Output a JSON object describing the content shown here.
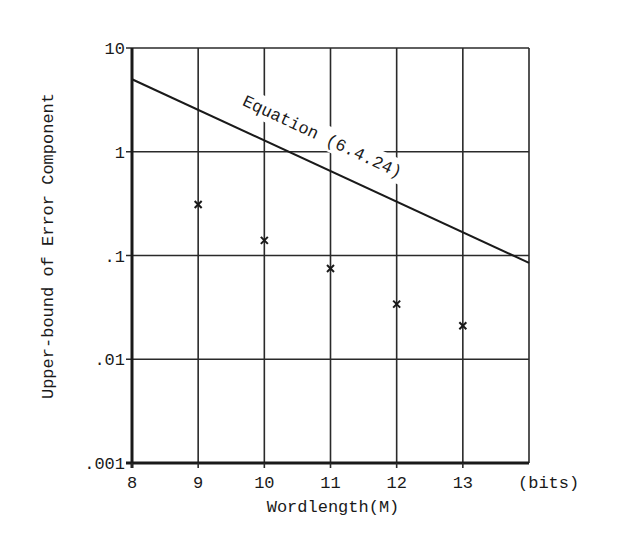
{
  "chart_data": {
    "type": "line",
    "title": "",
    "xlabel": "Wordlength(M)",
    "xunit": "(bits)",
    "ylabel": "Upper-bound of Error Component",
    "xlim": [
      8,
      14
    ],
    "ylim": [
      0.001,
      10
    ],
    "yscale": "log",
    "grid": true,
    "x_ticks": [
      8,
      9,
      10,
      11,
      12,
      13
    ],
    "x_tick_labels": [
      "8",
      "9",
      "10",
      "11",
      "12",
      "13"
    ],
    "y_ticks": [
      0.001,
      0.01,
      0.1,
      1,
      10
    ],
    "y_tick_labels": [
      ".001",
      ".01",
      ".1",
      "1",
      "10"
    ],
    "series": [
      {
        "name": "Equation (6.4.24)",
        "kind": "line",
        "x": [
          8,
          14
        ],
        "values": [
          5.0,
          0.085
        ]
      },
      {
        "name": "Measured",
        "kind": "scatter",
        "marker": "x",
        "x": [
          9,
          10,
          11,
          12,
          13
        ],
        "values": [
          0.31,
          0.14,
          0.075,
          0.034,
          0.021
        ]
      }
    ],
    "annotations": [
      {
        "text": "Equation (6.4.24)",
        "x": 10.9,
        "y": 1.4,
        "rotation_deg": 25
      }
    ]
  }
}
